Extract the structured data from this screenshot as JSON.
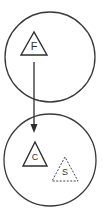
{
  "diagram": {
    "nodes": [
      {
        "id": "top-circle",
        "shape": "circle",
        "contains": [
          {
            "shape": "triangle",
            "style": "solid",
            "label": "F"
          }
        ]
      },
      {
        "id": "bottom-circle",
        "shape": "circle",
        "contains": [
          {
            "shape": "triangle",
            "style": "solid",
            "label": "C"
          },
          {
            "shape": "triangle",
            "style": "dashed",
            "label": "S"
          }
        ]
      }
    ],
    "edges": [
      {
        "from": "F",
        "to": "C",
        "type": "arrow",
        "direction": "down"
      }
    ],
    "labels": {
      "f": "F",
      "c": "C",
      "s": "S"
    },
    "colors": {
      "stroke": "#2e2e2e",
      "background": "#ffffff"
    }
  }
}
